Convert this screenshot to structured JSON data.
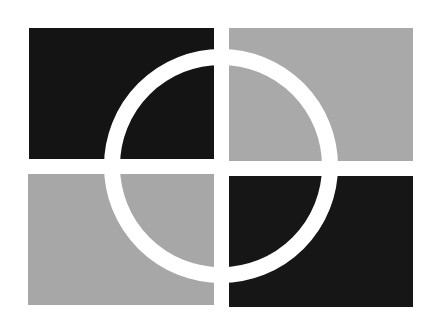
{
  "figure": {
    "colors": {
      "background": "#ffffff",
      "dark": "#141414",
      "light": "#a9a9a9",
      "ring": "#ffffff"
    },
    "quadrants": [
      {
        "position": "top-left",
        "color": "dark"
      },
      {
        "position": "top-right",
        "color": "light"
      },
      {
        "position": "bottom-left",
        "color": "light"
      },
      {
        "position": "bottom-right",
        "color": "dark"
      }
    ],
    "ring": {
      "cx": 221,
      "cy": 166,
      "outer_radius": 117,
      "inner_radius": 101
    }
  }
}
